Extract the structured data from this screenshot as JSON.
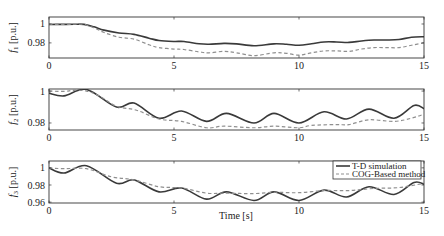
{
  "chart_data": [
    {
      "type": "line",
      "title": "",
      "xlabel": "",
      "ylabel": "f1 [p.u.]",
      "ylabel_main": "f",
      "ylabel_sub": "1",
      "ylabel_unit": " [p.u.]",
      "xlim": [
        0,
        15
      ],
      "ylim": [
        0.964,
        1.0074
      ],
      "xticks": [
        0,
        5,
        10,
        15
      ],
      "yticks": [
        1,
        0.98
      ],
      "ytick_labels": [
        "1",
        "0.98"
      ],
      "grid": false,
      "series": [
        {
          "name": "T-D simulation",
          "style": "solid",
          "x": [
            0,
            0.5,
            1.0,
            1.4,
            1.8,
            2.2,
            2.8,
            3.4,
            4.0,
            4.4,
            5.0,
            5.4,
            6.0,
            6.4,
            7.0,
            7.5,
            8.2,
            9.0,
            9.5,
            10.0,
            10.5,
            11.0,
            11.5,
            12.0,
            12.5,
            13.0,
            13.5,
            14.0,
            14.5,
            15.0
          ],
          "values": [
            0.9995,
            0.9996,
            0.9997,
            0.9996,
            0.997,
            0.9935,
            0.9905,
            0.989,
            0.985,
            0.9825,
            0.9815,
            0.9815,
            0.979,
            0.9785,
            0.9795,
            0.979,
            0.977,
            0.979,
            0.9785,
            0.9775,
            0.979,
            0.981,
            0.981,
            0.9805,
            0.982,
            0.983,
            0.983,
            0.9835,
            0.986,
            0.9865
          ]
        },
        {
          "name": "COG-Based method",
          "style": "dashed",
          "x": [
            0,
            0.5,
            1.0,
            1.4,
            1.8,
            2.2,
            2.8,
            3.4,
            4.0,
            4.4,
            5.0,
            5.4,
            6.0,
            6.4,
            7.0,
            7.5,
            8.2,
            9.0,
            9.5,
            10.0,
            10.5,
            11.0,
            11.5,
            12.0,
            12.5,
            13.0,
            13.5,
            14.0,
            14.5,
            15.0
          ],
          "values": [
            0.9995,
            0.9996,
            0.9997,
            0.9995,
            0.996,
            0.991,
            0.986,
            0.984,
            0.978,
            0.975,
            0.9735,
            0.973,
            0.9705,
            0.9695,
            0.971,
            0.9695,
            0.9665,
            0.9695,
            0.969,
            0.967,
            0.9695,
            0.9715,
            0.9715,
            0.971,
            0.9735,
            0.975,
            0.975,
            0.975,
            0.9775,
            0.98
          ]
        }
      ]
    },
    {
      "type": "line",
      "title": "",
      "xlabel": "",
      "ylabel": "f2 [p.u.]",
      "ylabel_main": "f",
      "ylabel_sub": "2",
      "ylabel_unit": " [p.u.]",
      "xlim": [
        0,
        15
      ],
      "ylim": [
        0.9756,
        1.0013
      ],
      "xticks": [
        0,
        5,
        10,
        15
      ],
      "yticks": [
        1,
        0.98
      ],
      "ytick_labels": [
        "1",
        "0.98"
      ],
      "grid": false,
      "series": [
        {
          "name": "T-D simulation",
          "style": "solid",
          "x": [
            0,
            0.6,
            1.5,
            2.7,
            3.4,
            4.4,
            5.3,
            6.3,
            7.1,
            8.2,
            9.0,
            10.0,
            11.0,
            11.9,
            12.8,
            13.8,
            14.6,
            15.0
          ],
          "values": [
            0.9987,
            0.997,
            1.001,
            0.99,
            0.9925,
            0.983,
            0.9875,
            0.981,
            0.986,
            0.98,
            0.986,
            0.98,
            0.987,
            0.9825,
            0.9887,
            0.983,
            0.991,
            0.989
          ]
        },
        {
          "name": "COG-Based method",
          "style": "dashed",
          "x": [
            0,
            0.6,
            1.0,
            1.5,
            2.0,
            2.7,
            3.5,
            4.4,
            5.3,
            6.3,
            7.0,
            8.2,
            9.0,
            10.0,
            10.5,
            11.5,
            12.0,
            12.8,
            13.8,
            14.5,
            15.0
          ],
          "values": [
            1.0,
            0.9998,
            1.0005,
            1.0,
            0.997,
            0.9905,
            0.988,
            0.9825,
            0.981,
            0.977,
            0.978,
            0.977,
            0.978,
            0.977,
            0.9785,
            0.979,
            0.979,
            0.982,
            0.981,
            0.983,
            0.9855
          ]
        }
      ]
    },
    {
      "type": "line",
      "title": "",
      "xlabel": "Time [s]",
      "ylabel": "f3 [p.u.]",
      "ylabel_main": "f",
      "ylabel_sub": "3",
      "ylabel_unit": " [p.u.]",
      "xlim": [
        0,
        15
      ],
      "ylim": [
        0.959,
        1.008
      ],
      "xticks": [
        0,
        5,
        10,
        15
      ],
      "yticks": [
        1,
        0.98,
        0.96
      ],
      "ytick_labels": [
        "1",
        "0.98",
        "0.96"
      ],
      "grid": false,
      "legend": {
        "position": "upper right",
        "entries": [
          "T-D simulation",
          "COG-Based method"
        ]
      },
      "series": [
        {
          "name": "T-D simulation",
          "style": "solid",
          "x": [
            0,
            0.6,
            1.5,
            2.7,
            3.4,
            4.4,
            5.3,
            6.3,
            7.1,
            8.2,
            9.0,
            10.0,
            11.0,
            11.9,
            12.8,
            13.8,
            14.6,
            15.0
          ],
          "values": [
            1.0,
            0.994,
            1.0025,
            0.982,
            0.986,
            0.972,
            0.9765,
            0.9635,
            0.972,
            0.962,
            0.972,
            0.962,
            0.974,
            0.966,
            0.978,
            0.969,
            0.983,
            0.981
          ]
        },
        {
          "name": "COG-Based method",
          "style": "dashed",
          "x": [
            0,
            0.6,
            1.5,
            2.5,
            3.4,
            4.4,
            5.3,
            6.3,
            7.0,
            8.2,
            9.0,
            10.0,
            11.0,
            12.0,
            13.0,
            14.0,
            15.0
          ],
          "values": [
            1.0,
            0.999,
            0.999,
            0.9895,
            0.986,
            0.978,
            0.9765,
            0.9705,
            0.9705,
            0.97,
            0.9715,
            0.971,
            0.9735,
            0.9735,
            0.976,
            0.977,
            0.982
          ]
        }
      ]
    }
  ],
  "legend": {
    "entries": [
      {
        "label": "T-D simulation",
        "style": "solid"
      },
      {
        "label": "COG-Based method",
        "style": "dashed"
      }
    ]
  },
  "colors": {
    "td_line": "#3a3a3a",
    "cog_line": "#8f8f8f",
    "axes": "#333333"
  },
  "xlabel": "Time [s]"
}
